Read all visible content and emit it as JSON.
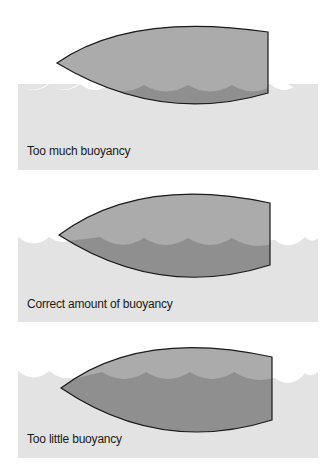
{
  "diagram": {
    "colors": {
      "water": "#e3e3e3",
      "hull_above": "#ababab",
      "hull_submerged": "#8f8f8f",
      "outline": "#1a1a1a",
      "text": "#1a1a1a"
    },
    "panels": [
      {
        "id": "too-much",
        "label": "Too much buoyancy"
      },
      {
        "id": "correct",
        "label": "Correct amount of buoyancy"
      },
      {
        "id": "too-little",
        "label": "Too little buoyancy"
      }
    ]
  }
}
